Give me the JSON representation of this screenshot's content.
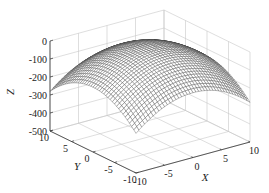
{
  "chart_data": {
    "type": "surface",
    "title": "",
    "xlabel": "X",
    "ylabel": "Y",
    "zlabel": "Z",
    "xlim": [
      -10,
      10
    ],
    "ylim": [
      -10,
      10
    ],
    "zlim": [
      -500,
      0
    ],
    "x_ticks": [
      -10,
      -5,
      0,
      5,
      10
    ],
    "y_ticks": [
      -10,
      -5,
      0,
      5,
      10
    ],
    "z_ticks": [
      0,
      -100,
      -200,
      -300,
      -400,
      -500
    ],
    "x_tick_labels": [
      "-10",
      "-5",
      "0",
      "5",
      "10"
    ],
    "y_tick_labels": [
      "-10",
      "-5",
      "0",
      "5",
      "10"
    ],
    "z_tick_labels": [
      "0",
      "-100",
      "-200",
      "-300",
      "-400",
      "-500"
    ],
    "surface": {
      "formula": "Z = -1.4 * (X^2 + Y^2)",
      "coef": -1.4,
      "grid_n": 41,
      "peak_z": 0,
      "corner_z": -280,
      "style": "wireframe mesh, grey lines on white"
    },
    "grid": true,
    "colors": {
      "mesh": "#3a3a3a",
      "grid": "#c8c8c8",
      "axis": "#333333"
    }
  }
}
